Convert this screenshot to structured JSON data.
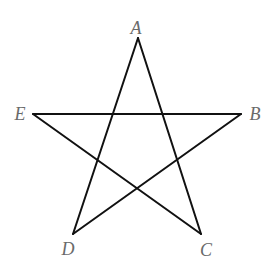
{
  "diagram": {
    "type": "pentagram",
    "stroke_color": "#111111",
    "label_color": "#6a6a6a",
    "stroke_width": 2,
    "points": {
      "A": {
        "x": 138,
        "y": 38
      },
      "B": {
        "x": 241,
        "y": 114
      },
      "C": {
        "x": 201,
        "y": 234
      },
      "D": {
        "x": 73,
        "y": 234
      },
      "E": {
        "x": 33,
        "y": 114
      }
    },
    "segments": [
      [
        "A",
        "D"
      ],
      [
        "A",
        "C"
      ],
      [
        "E",
        "B"
      ],
      [
        "E",
        "C"
      ],
      [
        "B",
        "D"
      ]
    ],
    "labels": [
      {
        "name": "A",
        "text": "A",
        "x": 136,
        "y": 28
      },
      {
        "name": "B",
        "text": "B",
        "x": 255,
        "y": 114
      },
      {
        "name": "C",
        "text": "C",
        "x": 206,
        "y": 250
      },
      {
        "name": "D",
        "text": "D",
        "x": 68,
        "y": 249
      },
      {
        "name": "E",
        "text": "E",
        "x": 20,
        "y": 114
      }
    ]
  }
}
